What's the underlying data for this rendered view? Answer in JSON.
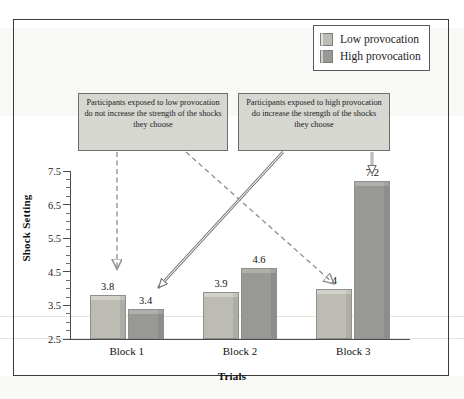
{
  "legend": {
    "items": [
      {
        "label": "Low provocation",
        "color": "#bcbcb4",
        "icon": "legend-swatch"
      },
      {
        "label": "High provocation",
        "color": "#989894",
        "icon": "legend-swatch"
      }
    ]
  },
  "callouts": [
    {
      "id": "low",
      "text": "Participants exposed to low provocation do not increase the strength of the shocks they choose",
      "arrow_style": "dashed"
    },
    {
      "id": "high",
      "text": "Participants exposed to high provocation do increase the strength of the shocks they choose",
      "arrow_style": "solid-outline"
    }
  ],
  "chart_data": {
    "type": "bar",
    "title": "",
    "xlabel": "Trials",
    "ylabel": "Shock Setting",
    "categories": [
      "Block 1",
      "Block 2",
      "Block 3"
    ],
    "series": [
      {
        "name": "Low provocation",
        "values": [
          3.8,
          3.9,
          4
        ],
        "labels": [
          "3.8",
          "3.9",
          "4"
        ],
        "color": "#bcbcb4"
      },
      {
        "name": "High provocation",
        "values": [
          3.4,
          4.6,
          7.2
        ],
        "labels": [
          "3.4",
          "4.6",
          "7.2"
        ],
        "color": "#989894"
      }
    ],
    "ylim": [
      2.5,
      7.5
    ],
    "ytick_labels": [
      "7.5",
      "6.5",
      "5.5",
      "4.5",
      "3.5",
      "2.5"
    ],
    "ytick_values": [
      7.5,
      6.5,
      5.5,
      4.5,
      3.5,
      2.5
    ],
    "ytick_minor_step": 0.25,
    "grid": false,
    "legend_position": "top-right"
  }
}
